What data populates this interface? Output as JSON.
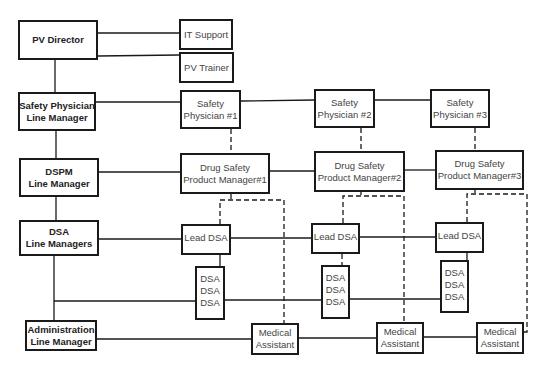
{
  "diagram": {
    "type": "org-chart",
    "managers": [
      {
        "id": "pv_director",
        "lines": [
          "PV Director"
        ]
      },
      {
        "id": "sp_lm",
        "lines": [
          "Safety Physician",
          "Line Manager"
        ]
      },
      {
        "id": "dspm_lm",
        "lines": [
          "DSPM",
          "Line Manager"
        ]
      },
      {
        "id": "dsa_lm",
        "lines": [
          "DSA",
          "Line Managers"
        ]
      },
      {
        "id": "admin_lm",
        "lines": [
          "Administration",
          "Line Manager"
        ]
      }
    ],
    "support": [
      {
        "id": "it_support",
        "lines": [
          "IT Support"
        ]
      },
      {
        "id": "pv_trainer",
        "lines": [
          "PV Trainer"
        ]
      }
    ],
    "safety_physicians": [
      {
        "lines": [
          "Safety",
          "Physician #1"
        ]
      },
      {
        "lines": [
          "Safety",
          "Physician #2"
        ]
      },
      {
        "lines": [
          "Safety",
          "Physician #3"
        ]
      }
    ],
    "dspms": [
      {
        "lines": [
          "Drug Safety",
          "Product Manager#1"
        ]
      },
      {
        "lines": [
          "Drug Safety",
          "Product Manager#2"
        ]
      },
      {
        "lines": [
          "Drug Safety",
          "Product Manager#3"
        ]
      }
    ],
    "lead_dsas": [
      {
        "lines": [
          "Lead DSA"
        ]
      },
      {
        "lines": [
          "Lead DSA"
        ]
      },
      {
        "lines": [
          "Lead DSA"
        ]
      }
    ],
    "dsa_groups": [
      {
        "lines": [
          "DSA",
          "DSA",
          "DSA"
        ]
      },
      {
        "lines": [
          "DSA",
          "DSA",
          "DSA"
        ]
      },
      {
        "lines": [
          "DSA",
          "DSA",
          "DSA"
        ]
      }
    ],
    "medical_assistants": [
      {
        "lines": [
          "Medical",
          "Assistant"
        ]
      },
      {
        "lines": [
          "Medical",
          "Assistant"
        ]
      },
      {
        "lines": [
          "Medical",
          "Assistant"
        ]
      }
    ],
    "legend": {
      "solid_line": "line management",
      "dashed_line": "functional reporting"
    },
    "colors": {
      "line": "#1a1a1a",
      "box_border": "#1a1a1a",
      "background": "#ffffff"
    }
  }
}
